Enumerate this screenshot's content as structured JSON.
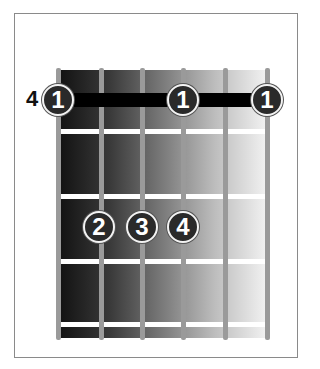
{
  "diagram": {
    "type": "guitar-chord-diagram",
    "start_fret_label": "4",
    "strings": 6,
    "frets_shown": 4,
    "barre": {
      "fret": 1,
      "from_string": 1,
      "to_string": 6,
      "finger": "1"
    },
    "fingers": [
      {
        "fret": 1,
        "string": 1,
        "label": "1"
      },
      {
        "fret": 1,
        "string": 4,
        "label": "1"
      },
      {
        "fret": 1,
        "string": 6,
        "label": "1"
      },
      {
        "fret": 3,
        "string": 2,
        "label": "2"
      },
      {
        "fret": 3,
        "string": 3,
        "label": "3"
      },
      {
        "fret": 3,
        "string": 4,
        "label": "4"
      }
    ],
    "colors": {
      "barre": "#000000",
      "dot_fill": "#2a2a2a",
      "dot_border": "#f3f3f3",
      "string": "#9a9a9a",
      "fret": "#ffffff"
    }
  }
}
